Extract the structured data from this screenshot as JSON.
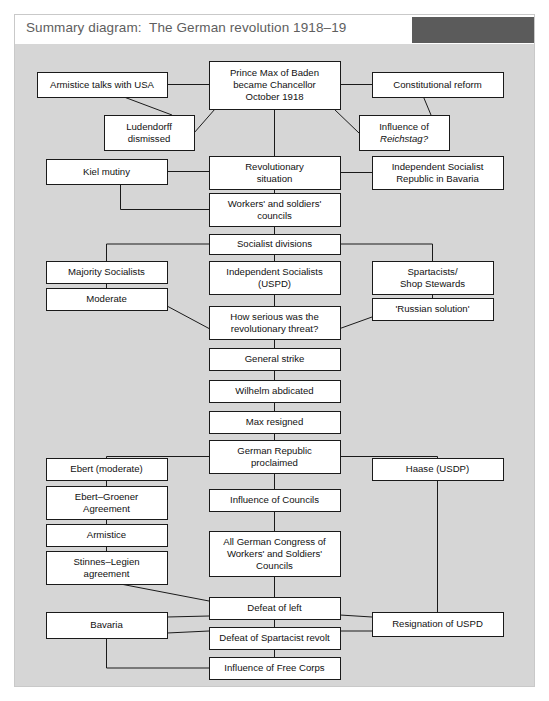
{
  "header": {
    "title": "Summary diagram:  The German revolution 1918–19",
    "accent_block_color": "#5b5b5b",
    "bar_background": "#ffffff"
  },
  "canvas": {
    "background": "#d6d6d6",
    "border_color": "#c9c9c9",
    "box_fill": "#ffffff",
    "line_color": "#1a1a1a"
  },
  "chart_data": {
    "type": "diagram",
    "title": "Summary diagram:  The German revolution 1918–19",
    "nodes": [
      {
        "id": "armistice_usa",
        "label": [
          "Armistice talks with USA"
        ],
        "x": 37,
        "y": 72,
        "w": 130,
        "h": 25
      },
      {
        "id": "prince_max",
        "label": [
          "Prince Max of Baden",
          "became Chancellor",
          "October 1918"
        ],
        "x": 209,
        "y": 61,
        "w": 131,
        "h": 48
      },
      {
        "id": "const_reform",
        "label": [
          "Constitutional reform"
        ],
        "x": 372,
        "y": 72,
        "w": 131,
        "h": 25
      },
      {
        "id": "ludendorff",
        "label": [
          "Ludendorff",
          "dismissed"
        ],
        "x": 104,
        "y": 115,
        "w": 90,
        "h": 35
      },
      {
        "id": "influence_reich",
        "label": [
          "Influence of",
          "Reichstag?"
        ],
        "x": 359,
        "y": 115,
        "w": 90,
        "h": 35,
        "italic_line": 1
      },
      {
        "id": "kiel_mutiny",
        "label": [
          "Kiel mutiny"
        ],
        "x": 46,
        "y": 159,
        "w": 121,
        "h": 25
      },
      {
        "id": "rev_situation",
        "label": [
          "Revolutionary",
          "situation"
        ],
        "x": 209,
        "y": 156,
        "w": 131,
        "h": 33
      },
      {
        "id": "bavaria_isr",
        "label": [
          "Independent Socialist",
          "Republic in Bavaria"
        ],
        "x": 372,
        "y": 156,
        "w": 131,
        "h": 33
      },
      {
        "id": "workers_councils",
        "label": [
          "Workers' and soldiers'",
          "councils"
        ],
        "x": 209,
        "y": 193,
        "w": 131,
        "h": 33
      },
      {
        "id": "soc_divisions",
        "label": [
          "Socialist divisions"
        ],
        "x": 209,
        "y": 234,
        "w": 131,
        "h": 20
      },
      {
        "id": "majority_soc",
        "label": [
          "Majority Socialists"
        ],
        "x": 46,
        "y": 261,
        "w": 121,
        "h": 22
      },
      {
        "id": "indep_soc",
        "label": [
          "Independent Socialists",
          "(USPD)"
        ],
        "x": 209,
        "y": 261,
        "w": 131,
        "h": 33
      },
      {
        "id": "spartacists",
        "label": [
          "Spartacists/",
          "Shop Stewards"
        ],
        "x": 372,
        "y": 261,
        "w": 121,
        "h": 33
      },
      {
        "id": "moderate",
        "label": [
          "Moderate"
        ],
        "x": 46,
        "y": 288,
        "w": 121,
        "h": 22
      },
      {
        "id": "russian_sol",
        "label": [
          "'Russian solution'"
        ],
        "x": 372,
        "y": 298,
        "w": 121,
        "h": 22
      },
      {
        "id": "how_serious",
        "label": [
          "How serious was the",
          "revolutionary threat?"
        ],
        "x": 209,
        "y": 306,
        "w": 131,
        "h": 33
      },
      {
        "id": "general_strike",
        "label": [
          "General strike"
        ],
        "x": 209,
        "y": 348,
        "w": 131,
        "h": 22
      },
      {
        "id": "wilhelm_abd",
        "label": [
          "Wilhelm abdicated"
        ],
        "x": 209,
        "y": 380,
        "w": 131,
        "h": 22
      },
      {
        "id": "max_resigned",
        "label": [
          "Max resigned"
        ],
        "x": 209,
        "y": 411,
        "w": 131,
        "h": 22
      },
      {
        "id": "german_republic",
        "label": [
          "German Republic",
          "proclaimed"
        ],
        "x": 209,
        "y": 440,
        "w": 131,
        "h": 33
      },
      {
        "id": "ebert_mod",
        "label": [
          "Ebert (moderate)"
        ],
        "x": 46,
        "y": 458,
        "w": 121,
        "h": 22
      },
      {
        "id": "haase",
        "label": [
          "Haase (USDP)"
        ],
        "x": 372,
        "y": 458,
        "w": 131,
        "h": 22
      },
      {
        "id": "ebert_groener",
        "label": [
          "Ebert–Groener",
          "Agreement"
        ],
        "x": 46,
        "y": 486,
        "w": 121,
        "h": 33
      },
      {
        "id": "influence_counc",
        "label": [
          "Influence of Councils"
        ],
        "x": 209,
        "y": 489,
        "w": 131,
        "h": 22
      },
      {
        "id": "armistice",
        "label": [
          "Armistice"
        ],
        "x": 46,
        "y": 524,
        "w": 121,
        "h": 22
      },
      {
        "id": "all_german_cong",
        "label": [
          "All German Congress of",
          "Workers' and Soldiers'",
          "Councils"
        ],
        "x": 209,
        "y": 531,
        "w": 131,
        "h": 45
      },
      {
        "id": "stinnes_legien",
        "label": [
          "Stinnes–Legien",
          "agreement"
        ],
        "x": 46,
        "y": 551,
        "w": 121,
        "h": 33
      },
      {
        "id": "defeat_left",
        "label": [
          "Defeat of left"
        ],
        "x": 209,
        "y": 597,
        "w": 131,
        "h": 22
      },
      {
        "id": "bavaria",
        "label": [
          "Bavaria"
        ],
        "x": 46,
        "y": 612,
        "w": 121,
        "h": 26
      },
      {
        "id": "resignation_uspd",
        "label": [
          "Resignation of USPD"
        ],
        "x": 372,
        "y": 612,
        "w": 131,
        "h": 24
      },
      {
        "id": "defeat_spart",
        "label": [
          "Defeat of Spartacist revolt"
        ],
        "x": 209,
        "y": 627,
        "w": 131,
        "h": 22
      },
      {
        "id": "free_corps",
        "label": [
          "Influence of Free Corps"
        ],
        "x": 209,
        "y": 657,
        "w": 131,
        "h": 22
      }
    ],
    "edges": [
      {
        "from": "armistice_usa",
        "to": "prince_max",
        "kind": "horizontal"
      },
      {
        "from": "prince_max",
        "to": "const_reform",
        "kind": "horizontal"
      },
      {
        "from": "armistice_usa",
        "to": "ludendorff",
        "kind": "diagonal"
      },
      {
        "from": "prince_max",
        "to": "ludendorff",
        "kind": "diagonal"
      },
      {
        "from": "prince_max",
        "to": "influence_reich",
        "kind": "diagonal"
      },
      {
        "from": "const_reform",
        "to": "influence_reich",
        "kind": "diagonal"
      },
      {
        "from": "prince_max",
        "to": "rev_situation",
        "kind": "vertical"
      },
      {
        "from": "kiel_mutiny",
        "to": "rev_situation",
        "kind": "horizontal"
      },
      {
        "from": "rev_situation",
        "to": "bavaria_isr",
        "kind": "horizontal"
      },
      {
        "from": "kiel_mutiny",
        "to": "workers_councils",
        "kind": "elbow"
      },
      {
        "from": "rev_situation",
        "to": "workers_councils",
        "kind": "vertical"
      },
      {
        "from": "workers_councils",
        "to": "soc_divisions",
        "kind": "vertical"
      },
      {
        "from": "soc_divisions",
        "to": "majority_soc",
        "kind": "elbow"
      },
      {
        "from": "soc_divisions",
        "to": "indep_soc",
        "kind": "vertical"
      },
      {
        "from": "soc_divisions",
        "to": "spartacists",
        "kind": "elbow"
      },
      {
        "from": "majority_soc",
        "to": "moderate",
        "kind": "vertical"
      },
      {
        "from": "spartacists",
        "to": "russian_sol",
        "kind": "vertical"
      },
      {
        "from": "moderate",
        "to": "how_serious",
        "kind": "diagonal"
      },
      {
        "from": "indep_soc",
        "to": "how_serious",
        "kind": "vertical"
      },
      {
        "from": "russian_sol",
        "to": "how_serious",
        "kind": "diagonal"
      },
      {
        "from": "how_serious",
        "to": "general_strike",
        "kind": "vertical"
      },
      {
        "from": "general_strike",
        "to": "wilhelm_abd",
        "kind": "vertical"
      },
      {
        "from": "wilhelm_abd",
        "to": "max_resigned",
        "kind": "vertical"
      },
      {
        "from": "max_resigned",
        "to": "german_republic",
        "kind": "vertical"
      },
      {
        "from": "german_republic",
        "to": "ebert_mod",
        "kind": "elbow"
      },
      {
        "from": "german_republic",
        "to": "haase",
        "kind": "elbow"
      },
      {
        "from": "german_republic",
        "to": "influence_counc",
        "kind": "vertical"
      },
      {
        "from": "ebert_mod",
        "to": "ebert_groener",
        "kind": "vertical"
      },
      {
        "from": "ebert_groener",
        "to": "armistice",
        "kind": "vertical"
      },
      {
        "from": "armistice",
        "to": "stinnes_legien",
        "kind": "vertical"
      },
      {
        "from": "influence_counc",
        "to": "all_german_cong",
        "kind": "vertical"
      },
      {
        "from": "all_german_cong",
        "to": "defeat_left",
        "kind": "vertical"
      },
      {
        "from": "stinnes_legien",
        "to": "defeat_left",
        "kind": "diagonal"
      },
      {
        "from": "bavaria",
        "to": "defeat_left",
        "kind": "diagonal"
      },
      {
        "from": "defeat_left",
        "to": "resignation_uspd",
        "kind": "diagonal"
      },
      {
        "from": "haase",
        "to": "resignation_uspd",
        "kind": "vertical"
      },
      {
        "from": "bavaria",
        "to": "defeat_spart",
        "kind": "diagonal"
      },
      {
        "from": "defeat_spart",
        "to": "resignation_uspd",
        "kind": "diagonal"
      },
      {
        "from": "defeat_left",
        "to": "defeat_spart",
        "kind": "vertical"
      },
      {
        "from": "defeat_spart",
        "to": "free_corps",
        "kind": "vertical"
      },
      {
        "from": "bavaria",
        "to": "free_corps",
        "kind": "elbow"
      }
    ]
  }
}
